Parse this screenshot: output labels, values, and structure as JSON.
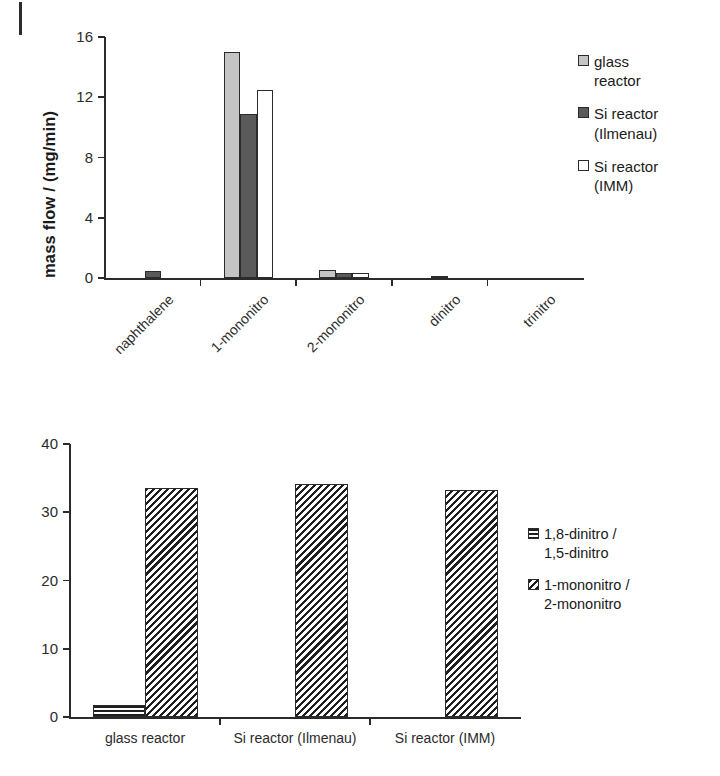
{
  "page": {
    "margin_mark": "page-margin-rule"
  },
  "figures": [
    {
      "id": "mass-flow-chart",
      "legend_position": "right"
    },
    {
      "id": "ratio-chart",
      "legend_position": "right"
    }
  ],
  "chart_data": [
    {
      "type": "bar",
      "title": "",
      "xlabel": "",
      "ylabel": "mass flow / (mg/min)",
      "ylim": [
        0,
        16
      ],
      "yticks": [
        0,
        4,
        8,
        12,
        16
      ],
      "ytick_labels": [
        "0",
        "4",
        "8",
        "12",
        "16"
      ],
      "grid": false,
      "legend_position": "right",
      "categories": [
        "naphthalene",
        "1-mononitro",
        "2-mononitro",
        "dinitro",
        "trinitro"
      ],
      "series": [
        {
          "name": "glass reactor",
          "legend_label": "glass\nreactor",
          "fill": "light-gray",
          "color": "#c4c4c4",
          "values": [
            0.0,
            15.0,
            0.5,
            0.0,
            0.0
          ]
        },
        {
          "name": "Si reactor (Ilmenau)",
          "legend_label": "Si reactor\n(Ilmenau)",
          "fill": "dark-gray",
          "color": "#5a5a5a",
          "values": [
            0.45,
            10.9,
            0.3,
            0.12,
            0.0
          ]
        },
        {
          "name": "Si reactor (IMM)",
          "legend_label": "Si reactor\n(IMM)",
          "fill": "white",
          "color": "#ffffff",
          "values": [
            0.0,
            12.5,
            0.3,
            0.0,
            0.0
          ]
        }
      ]
    },
    {
      "type": "bar",
      "title": "",
      "xlabel": "",
      "ylabel": "",
      "ylim": [
        0,
        40
      ],
      "yticks": [
        0,
        10,
        20,
        30,
        40
      ],
      "ytick_labels": [
        "0",
        "10",
        "20",
        "30",
        "40"
      ],
      "grid": false,
      "legend_position": "right",
      "categories": [
        "glass reactor",
        "Si reactor (Ilmenau)",
        "Si reactor (IMM)"
      ],
      "series": [
        {
          "name": "1,8-dinitro / 1,5-dinitro",
          "legend_label": "1,8-dinitro /\n1,5-dinitro",
          "fill": "horizontal-hatch",
          "color": "#1f1f1f",
          "values": [
            1.7,
            0.0,
            0.0
          ]
        },
        {
          "name": "1-mononitro / 2-mononitro",
          "legend_label": "1-mononitro /\n2-mononitro",
          "fill": "diagonal-hatch",
          "color": "#1f1f1f",
          "values": [
            33.6,
            34.1,
            33.3
          ]
        }
      ]
    }
  ]
}
